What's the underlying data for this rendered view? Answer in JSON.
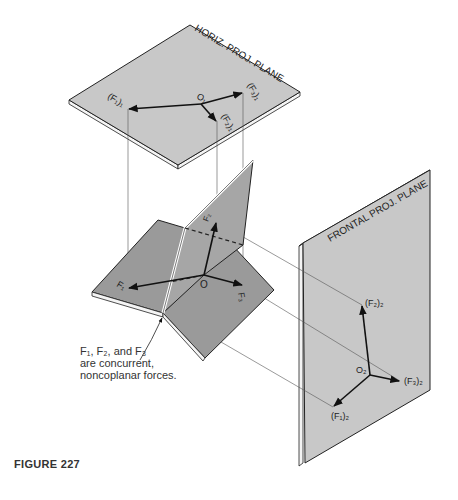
{
  "figure": {
    "caption": "FIGURE 227",
    "note_lines": [
      "F₁, F₂, and F₃",
      "are concurrent,",
      "noncoplanar forces."
    ]
  },
  "horizontal_plane": {
    "title": "HORIZ. PROJ. PLANE",
    "origin_label": "O₁",
    "vectors": [
      {
        "label": "(F₁)₁"
      },
      {
        "label": "(F₂)₁"
      },
      {
        "label": "(F₃)₁"
      }
    ]
  },
  "frontal_plane": {
    "title": "FRONTAL PROJ. PLANE",
    "origin_label": "O₂",
    "vectors": [
      {
        "label": "(F₁)₂"
      },
      {
        "label": "(F₂)₂"
      },
      {
        "label": "(F₃)₂"
      }
    ]
  },
  "space_figure": {
    "origin_label": "O",
    "vectors": [
      {
        "label": "F₁"
      },
      {
        "label": "F₂"
      },
      {
        "label": "F₃"
      }
    ]
  },
  "colors": {
    "plane_fill": "#c8c8c8",
    "central_plane_fill": "#9a9a9a",
    "line": "#1a1a1a",
    "projector": "#555555"
  }
}
